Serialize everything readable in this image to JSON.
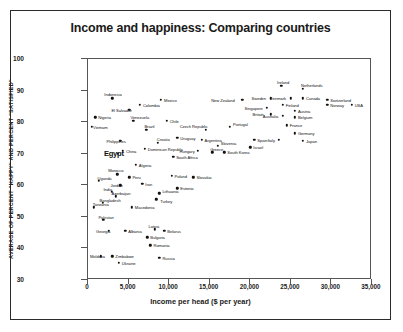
{
  "chart_data": {
    "type": "scatter",
    "title": "Income and happiness: Comparing countries",
    "xlabel": "Income per head ($ per year)",
    "ylabel": "AVERAGE OF PERCENT \"HAPPY\" AND PERCENT \"SATISFIED\"",
    "xlim": [
      0,
      35000
    ],
    "ylim": [
      30,
      100
    ],
    "xticks": [
      "0",
      "5,000",
      "10,000",
      "15,000",
      "20,000",
      "25,000",
      "30,000",
      "35,000"
    ],
    "xtick_values": [
      0,
      5000,
      10000,
      15000,
      20000,
      25000,
      30000,
      35000
    ],
    "yticks": [
      "30",
      "40",
      "50",
      "60",
      "70",
      "80",
      "90",
      "100"
    ],
    "ytick_values": [
      30,
      40,
      50,
      60,
      70,
      80,
      90,
      100
    ],
    "grid": false,
    "legend": "none",
    "points": [
      {
        "name": "Indonesia",
        "x": 3000,
        "y": 87.5,
        "lx": -8,
        "ly": -5
      },
      {
        "name": "Nigeria",
        "x": 900,
        "y": 81.5,
        "lx": 3,
        "ly": -1
      },
      {
        "name": "Vietnam",
        "x": 500,
        "y": 78.5,
        "lx": 1,
        "ly": -1
      },
      {
        "name": "Colombia",
        "x": 6400,
        "y": 85.5,
        "lx": 3,
        "ly": -1
      },
      {
        "name": "El Salvador",
        "x": 5100,
        "y": 84.0,
        "lx": -18,
        "ly": -1
      },
      {
        "name": "Mexico",
        "x": 9000,
        "y": 87.0,
        "lx": 3,
        "ly": -1
      },
      {
        "name": "Venezuela",
        "x": 5600,
        "y": 80.5,
        "lx": -3,
        "ly": -5
      },
      {
        "name": "Chile",
        "x": 9700,
        "y": 80.5,
        "lx": 3,
        "ly": -1
      },
      {
        "name": "Brazil",
        "x": 7200,
        "y": 77.5,
        "lx": -2,
        "ly": -5
      },
      {
        "name": "Philippines",
        "x": 4000,
        "y": 74.0,
        "lx": -14,
        "ly": -1
      },
      {
        "name": "Croatia",
        "x": 8600,
        "y": 73.5,
        "lx": -1,
        "ly": -5
      },
      {
        "name": "Uruguay",
        "x": 11000,
        "y": 75.0,
        "lx": 3,
        "ly": -1
      },
      {
        "name": "Egypt",
        "x": 3700,
        "y": 70.0,
        "lx": -14,
        "ly": -4
      },
      {
        "name": "China",
        "x": 4300,
        "y": 71.0,
        "lx": 3,
        "ly": -1
      },
      {
        "name": "Dominican Republic",
        "x": 7000,
        "y": 71.5,
        "lx": 3,
        "ly": -1
      },
      {
        "name": "Hungary",
        "x": 13500,
        "y": 71.0,
        "lx": -18,
        "ly": 0
      },
      {
        "name": "South Africa",
        "x": 10500,
        "y": 69.0,
        "lx": 3,
        "ly": -1
      },
      {
        "name": "Algeria",
        "x": 5900,
        "y": 66.5,
        "lx": 3,
        "ly": -1
      },
      {
        "name": "Morocco",
        "x": 3600,
        "y": 63.5,
        "lx": -9,
        "ly": -5
      },
      {
        "name": "Uganda",
        "x": 1300,
        "y": 61.5,
        "lx": -1,
        "ly": -4
      },
      {
        "name": "Jordan",
        "x": 4000,
        "y": 60.0,
        "lx": -10,
        "ly": 0
      },
      {
        "name": "Peru",
        "x": 5100,
        "y": 62.5,
        "lx": 3,
        "ly": -1
      },
      {
        "name": "Iran",
        "x": 6700,
        "y": 60.5,
        "lx": 3,
        "ly": -1
      },
      {
        "name": "Poland",
        "x": 10300,
        "y": 63.0,
        "lx": 3,
        "ly": -1
      },
      {
        "name": "Slovakia",
        "x": 13000,
        "y": 62.5,
        "lx": 3,
        "ly": -1
      },
      {
        "name": "Estonia",
        "x": 11000,
        "y": 59.0,
        "lx": 3,
        "ly": -1
      },
      {
        "name": "India",
        "x": 2900,
        "y": 58.0,
        "lx": -8,
        "ly": -4
      },
      {
        "name": "Azerbaijan",
        "x": 3400,
        "y": 56.5,
        "lx": -4,
        "ly": -4
      },
      {
        "name": "Lithuania",
        "x": 8800,
        "y": 57.5,
        "lx": 3,
        "ly": -3
      },
      {
        "name": "Turkey",
        "x": 8400,
        "y": 55.5,
        "lx": 4,
        "ly": 1
      },
      {
        "name": "Bangladesh",
        "x": 1800,
        "y": 54.5,
        "lx": -3,
        "ly": -4
      },
      {
        "name": "Tanzania",
        "x": 700,
        "y": 53.0,
        "lx": -1,
        "ly": -4
      },
      {
        "name": "Macedonia",
        "x": 5400,
        "y": 53.0,
        "lx": 3,
        "ly": -1
      },
      {
        "name": "Pakistan",
        "x": 1900,
        "y": 49.0,
        "lx": -5,
        "ly": -4
      },
      {
        "name": "Georgia",
        "x": 2600,
        "y": 45.5,
        "lx": -13,
        "ly": 0
      },
      {
        "name": "Albania",
        "x": 4600,
        "y": 45.5,
        "lx": 3,
        "ly": -1
      },
      {
        "name": "Latvia",
        "x": 8200,
        "y": 46.0,
        "lx": -6,
        "ly": -4
      },
      {
        "name": "Belarus",
        "x": 9400,
        "y": 45.5,
        "lx": 3,
        "ly": -1
      },
      {
        "name": "Bulgaria",
        "x": 7300,
        "y": 43.5,
        "lx": 3,
        "ly": -1
      },
      {
        "name": "Romania",
        "x": 7700,
        "y": 41.0,
        "lx": 3,
        "ly": -1
      },
      {
        "name": "Moldova",
        "x": 1600,
        "y": 37.5,
        "lx": -11,
        "ly": 0
      },
      {
        "name": "Zimbabwe",
        "x": 3000,
        "y": 37.5,
        "lx": 3,
        "ly": -1
      },
      {
        "name": "Ukraine",
        "x": 3800,
        "y": 35.5,
        "lx": 3,
        "ly": -1
      },
      {
        "name": "Russia",
        "x": 8800,
        "y": 37.0,
        "lx": 3,
        "ly": -1
      },
      {
        "name": "Czech Republic",
        "x": 14500,
        "y": 77.5,
        "lx": -26,
        "ly": -5
      },
      {
        "name": "New Zealand",
        "x": 19000,
        "y": 87.0,
        "lx": -31,
        "ly": 0
      },
      {
        "name": "Portugal",
        "x": 17500,
        "y": 78.5,
        "lx": 3,
        "ly": -4
      },
      {
        "name": "Argentina",
        "x": 14000,
        "y": 74.5,
        "lx": 3,
        "ly": -1
      },
      {
        "name": "Slovenia",
        "x": 16000,
        "y": 72.5,
        "lx": 3,
        "ly": -4
      },
      {
        "name": "Greece",
        "x": 15300,
        "y": 70.5,
        "lx": -2,
        "ly": -4
      },
      {
        "name": "Spain",
        "x": 20500,
        "y": 74.5,
        "lx": 3,
        "ly": -1
      },
      {
        "name": "Israel",
        "x": 20000,
        "y": 72.0,
        "lx": 3,
        "ly": -1
      },
      {
        "name": "South Korea",
        "x": 16800,
        "y": 70.5,
        "lx": 3,
        "ly": -1
      },
      {
        "name": "Ireland",
        "x": 23800,
        "y": 91.5,
        "lx": -4,
        "ly": -5
      },
      {
        "name": "Netherlands",
        "x": 26500,
        "y": 90.5,
        "lx": -2,
        "ly": -5
      },
      {
        "name": "Sweden",
        "x": 22500,
        "y": 87.5,
        "lx": -19,
        "ly": 0
      },
      {
        "name": "Denmark",
        "x": 25000,
        "y": 87.5,
        "lx": -21,
        "ly": 0
      },
      {
        "name": "Canada",
        "x": 26500,
        "y": 87.5,
        "lx": 3,
        "ly": -1
      },
      {
        "name": "Finland",
        "x": 24000,
        "y": 85.5,
        "lx": 3,
        "ly": -1
      },
      {
        "name": "Switzerland",
        "x": 29500,
        "y": 87.0,
        "lx": 3,
        "ly": -1
      },
      {
        "name": "Norway",
        "x": 29500,
        "y": 85.5,
        "lx": 3,
        "ly": -1
      },
      {
        "name": "USA",
        "x": 32500,
        "y": 85.5,
        "lx": 3,
        "ly": -1
      },
      {
        "name": "Singapore",
        "x": 22000,
        "y": 84.5,
        "lx": -22,
        "ly": 0
      },
      {
        "name": "Britain",
        "x": 22500,
        "y": 82.5,
        "lx": -18,
        "ly": 0
      },
      {
        "name": "Austria",
        "x": 25500,
        "y": 83.5,
        "lx": 3,
        "ly": -1
      },
      {
        "name": "Australia",
        "x": 24000,
        "y": 82.0,
        "lx": -20,
        "ly": 0
      },
      {
        "name": "Belgium",
        "x": 25500,
        "y": 81.5,
        "lx": 3,
        "ly": -1
      },
      {
        "name": "France",
        "x": 24500,
        "y": 79.0,
        "lx": 3,
        "ly": -1
      },
      {
        "name": "Germany",
        "x": 25500,
        "y": 76.5,
        "lx": 3,
        "ly": -1
      },
      {
        "name": "Italy",
        "x": 23500,
        "y": 74.5,
        "lx": -11,
        "ly": 0
      },
      {
        "name": "Japan",
        "x": 26500,
        "y": 74.0,
        "lx": 3,
        "ly": -1
      }
    ]
  }
}
